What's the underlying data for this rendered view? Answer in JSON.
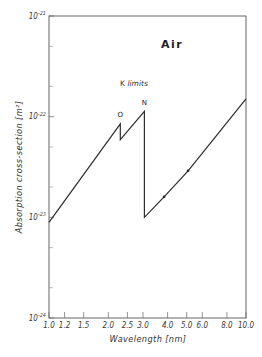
{
  "chart_data": {
    "type": "line",
    "title": "Air",
    "xlabel": "Wavelength [nm]",
    "ylabel": "Absorption cross-section [m²]",
    "xscale": "log",
    "yscale": "log",
    "xlim": [
      1.0,
      10.0
    ],
    "ylim": [
      1e-24,
      1e-21
    ],
    "grid": false,
    "legend": null,
    "x_ticks": [
      1.0,
      1.2,
      1.5,
      2.0,
      2.5,
      3.0,
      4.0,
      5.0,
      6.0,
      8.0,
      10.0
    ],
    "x_tick_labels": [
      "1.0",
      "1.2",
      "1.5",
      "2.0",
      "2.5",
      "3.0",
      "4.0",
      "5.0",
      "6.0",
      "8.0",
      "10.0"
    ],
    "y_ticks": [
      1e-24,
      1e-23,
      1e-22,
      1e-21
    ],
    "y_tick_labels": [
      {
        "base": "10",
        "exp": "-24"
      },
      {
        "base": "10",
        "exp": "-23"
      },
      {
        "base": "10",
        "exp": "-22"
      },
      {
        "base": "10",
        "exp": "-21"
      }
    ],
    "y_minor_ticks": [
      2e-24,
      5e-24,
      2e-23,
      5e-23,
      2e-22,
      5e-22
    ],
    "series": [
      {
        "name": "Air",
        "x": [
          1.0,
          2.3,
          2.3,
          3.05,
          3.05,
          3.84,
          5.08,
          10.0
        ],
        "y": [
          8.9e-24,
          8.5e-23,
          5.9e-23,
          1.13e-22,
          1e-23,
          1.6e-23,
          2.9e-23,
          1.5e-22
        ]
      }
    ],
    "markers": [
      {
        "x": 3.84,
        "y": 1.6e-23
      },
      {
        "x": 5.08,
        "y": 2.9e-23
      }
    ],
    "annotations": [
      {
        "text": "K limits",
        "x": 2.7,
        "y": 2e-22
      },
      {
        "text": "O",
        "x": 2.3,
        "y": 1e-22
      },
      {
        "text": "N",
        "x": 3.05,
        "y": 1.3e-22
      }
    ]
  }
}
